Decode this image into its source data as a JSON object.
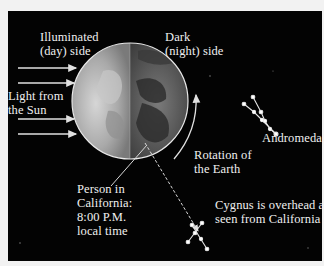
{
  "labels": {
    "illuminated": "Illuminated\n(day) side",
    "dark": "Dark\n(night) side",
    "light_from_sun": "Light from\nthe Sun",
    "andromeda": "Andromeda",
    "rotation": "Rotation of\nthe Earth",
    "person": "Person in\nCalifornia:\n8:00 P.M.\nlocal time",
    "cygnus": "Cygnus is overhead as\nseen from California"
  },
  "colors": {
    "background": "#030303",
    "page": "#f2f2f2",
    "text": "#f0f0f0",
    "day_side": "#a8a8a8",
    "night_side": "#555555"
  }
}
